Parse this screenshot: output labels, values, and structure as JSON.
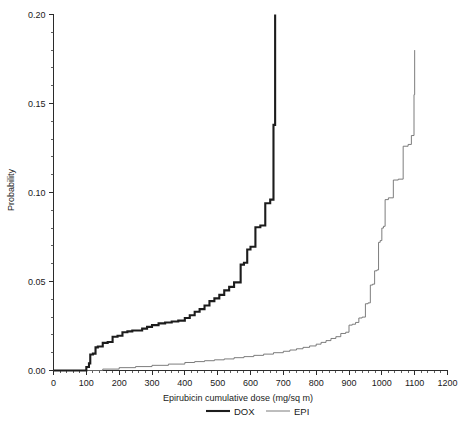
{
  "chart_data": {
    "type": "line",
    "title": "",
    "subtitle": "",
    "xlabel": "Epirubicin cumulative dose (mg/sq m)",
    "ylabel": "Probability",
    "xlim": [
      0,
      1200
    ],
    "ylim": [
      0.0,
      0.2
    ],
    "grid": false,
    "legend_position": "bottom",
    "x_major_ticks": [
      0,
      100,
      200,
      300,
      400,
      500,
      600,
      700,
      800,
      900,
      1000,
      1100,
      1200
    ],
    "x_tick_labels": [
      "0",
      "100",
      "200",
      "300",
      "400",
      "500",
      "600",
      "700",
      "800",
      "900",
      "1000",
      "1100",
      "1200"
    ],
    "x_minor_interval": 20,
    "y_major_ticks": [
      0.0,
      0.05,
      0.1,
      0.15,
      0.2
    ],
    "y_tick_labels": [
      "0.00",
      "0.05",
      "0.10",
      "0.15",
      "0.20"
    ],
    "y_minor_interval": 0.01,
    "legend": [
      {
        "name": "DOX",
        "color": "#1c1c1c",
        "line_width": 2.1
      },
      {
        "name": "EPI",
        "color": "#6e6e6e",
        "line_width": 0.9
      }
    ],
    "series": [
      {
        "name": "DOX",
        "style": "step-post",
        "color": "#1c1c1c",
        "x": [
          0,
          95,
          100,
          108,
          112,
          120,
          128,
          135,
          150,
          165,
          180,
          195,
          210,
          225,
          240,
          255,
          270,
          285,
          300,
          320,
          340,
          360,
          380,
          400,
          415,
          430,
          445,
          460,
          475,
          490,
          505,
          520,
          535,
          550,
          560,
          570,
          580,
          590,
          600,
          615,
          630,
          645,
          660,
          670,
          675
        ],
        "y": [
          0.0,
          0.0,
          0.002,
          0.004,
          0.009,
          0.0095,
          0.013,
          0.0135,
          0.0155,
          0.016,
          0.019,
          0.0195,
          0.0215,
          0.022,
          0.0225,
          0.0225,
          0.0235,
          0.0245,
          0.0255,
          0.0265,
          0.027,
          0.0275,
          0.028,
          0.0295,
          0.031,
          0.033,
          0.0345,
          0.0365,
          0.039,
          0.0405,
          0.0425,
          0.045,
          0.047,
          0.0495,
          0.0495,
          0.0595,
          0.0605,
          0.068,
          0.0695,
          0.0805,
          0.0815,
          0.094,
          0.096,
          0.138,
          0.2
        ]
      },
      {
        "name": "EPI",
        "style": "step-post",
        "color": "#6e6e6e",
        "x": [
          0,
          100,
          150,
          200,
          250,
          300,
          350,
          400,
          430,
          460,
          490,
          520,
          550,
          580,
          610,
          640,
          670,
          700,
          720,
          740,
          760,
          780,
          800,
          815,
          830,
          845,
          860,
          875,
          890,
          900,
          910,
          920,
          930,
          940,
          950,
          958,
          965,
          972,
          978,
          985,
          990,
          995,
          1000,
          1005,
          1010,
          1020,
          1035,
          1050,
          1065,
          1080,
          1090,
          1098,
          1100
        ],
        "y": [
          0.0,
          0.0,
          0.0008,
          0.0016,
          0.0022,
          0.0029,
          0.0036,
          0.0045,
          0.005,
          0.0055,
          0.006,
          0.0065,
          0.0072,
          0.0078,
          0.0085,
          0.0092,
          0.01,
          0.0108,
          0.0115,
          0.0122,
          0.013,
          0.0138,
          0.0148,
          0.0158,
          0.0168,
          0.018,
          0.019,
          0.0208,
          0.0215,
          0.0255,
          0.026,
          0.027,
          0.0295,
          0.03,
          0.0375,
          0.038,
          0.048,
          0.0485,
          0.056,
          0.0565,
          0.072,
          0.073,
          0.08,
          0.081,
          0.096,
          0.097,
          0.107,
          0.1075,
          0.126,
          0.127,
          0.132,
          0.155,
          0.18
        ]
      }
    ]
  },
  "axes": {
    "y_axis_title": "Probability",
    "x_axis_title": "Epirubicin cumulative dose (mg/sq m)"
  },
  "legend_entries": {
    "dox": "DOX",
    "epi": "EPI"
  },
  "colors": {
    "dox": "#1c1c1c",
    "epi": "#6e6e6e",
    "axis": "#2b2b2b",
    "background": "#ffffff"
  }
}
